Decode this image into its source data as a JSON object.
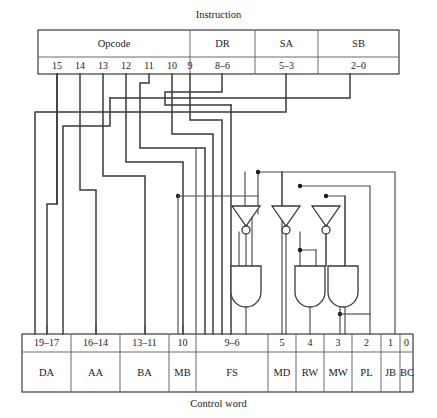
{
  "diagram": {
    "top_caption": "Instruction",
    "bottom_caption": "Control word",
    "line_color": "#4a4a4a",
    "box_border_color": "#4a4a4a",
    "text_color": "#1a1a1a",
    "background": "#ffffff"
  },
  "instruction": {
    "fields": [
      {
        "name": "Opcode",
        "bits": ""
      },
      {
        "name": "DR",
        "bits": "8–6"
      },
      {
        "name": "SA",
        "bits": "5–3"
      },
      {
        "name": "SB",
        "bits": "2–0"
      }
    ],
    "opcode_bits": [
      "15",
      "14",
      "13",
      "12",
      "11",
      "10",
      "9"
    ]
  },
  "control_word": {
    "cells": [
      {
        "bits": "19–17",
        "name": "DA"
      },
      {
        "bits": "16–14",
        "name": "AA"
      },
      {
        "bits": "13–11",
        "name": "BA"
      },
      {
        "bits": "10",
        "name": "MB"
      },
      {
        "bits": "9–6",
        "name": "FS"
      },
      {
        "bits": "5",
        "name": "MD"
      },
      {
        "bits": "4",
        "name": "RW"
      },
      {
        "bits": "3",
        "name": "MW"
      },
      {
        "bits": "2",
        "name": "PL"
      },
      {
        "bits": "1",
        "name": "JB"
      },
      {
        "bits": "0",
        "name": "BC"
      }
    ]
  },
  "gates": {
    "inverters": [
      {
        "id": "inv-fs",
        "label": "NOT"
      },
      {
        "id": "inv-rw",
        "label": "NOT"
      },
      {
        "id": "inv-mw",
        "label": "NOT"
      }
    ],
    "and_gates": [
      {
        "id": "and-fs",
        "label": "AND"
      },
      {
        "id": "and-mw",
        "label": "AND"
      },
      {
        "id": "and-pl",
        "label": "AND"
      }
    ]
  }
}
